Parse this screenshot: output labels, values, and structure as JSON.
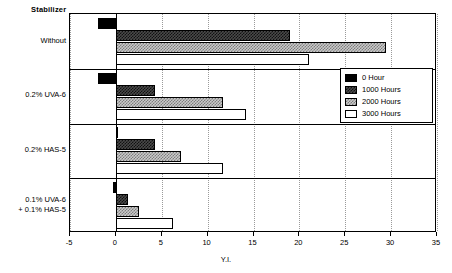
{
  "chart_data": {
    "type": "bar",
    "orientation": "horizontal",
    "title": "Stabilizer",
    "xlabel": "Y.I.",
    "ylabel": "",
    "xlim": [
      -5,
      35
    ],
    "xticks": [
      -5,
      0,
      5,
      10,
      15,
      20,
      25,
      30,
      35
    ],
    "xtick_labels": [
      "-5",
      "0",
      "5",
      "10",
      "15",
      "20",
      "25",
      "30",
      "35"
    ],
    "grid": true,
    "grid_axis": "x",
    "legend_position": "upper right",
    "categories": [
      "Without",
      "0.2% UVA-6",
      "0.2% HAS-5",
      "0.1% UVA-6\n+ 0.1% HAS-5"
    ],
    "series": [
      {
        "name": "0 Hour",
        "values": [
          -2.0,
          -2.0,
          0.0,
          -0.3
        ]
      },
      {
        "name": "1000 Hours",
        "values": [
          19.0,
          4.3,
          4.3,
          1.3
        ]
      },
      {
        "name": "2000 Hours",
        "values": [
          29.4,
          11.7,
          7.1,
          2.5
        ]
      },
      {
        "name": "3000 Hours",
        "values": [
          21.0,
          14.2,
          11.7,
          6.2
        ]
      }
    ]
  },
  "legend": {
    "items": [
      {
        "label": "0 Hour",
        "pattern": "solid-black"
      },
      {
        "label": "1000 Hours",
        "pattern": "dark-checker"
      },
      {
        "label": "2000 Hours",
        "pattern": "light-checker"
      },
      {
        "label": "3000 Hours",
        "pattern": "white"
      }
    ]
  },
  "axis": {
    "x_title": "Y.I.",
    "tick_labels": [
      "-5",
      "0",
      "5",
      "10",
      "15",
      "20",
      "25",
      "30",
      "35"
    ]
  },
  "title": {
    "text": "Stabilizer"
  }
}
